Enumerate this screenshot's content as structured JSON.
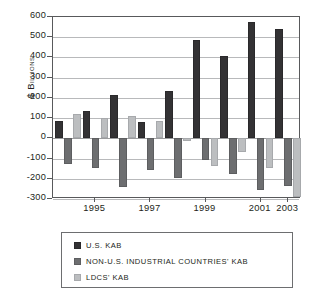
{
  "chart_data": {
    "type": "bar",
    "title": "",
    "subtitle": "",
    "xlabel": "",
    "ylabel": "$ BILLIONS",
    "ylim": [
      -300,
      600
    ],
    "ytick_values": [
      600,
      500,
      400,
      300,
      200,
      100,
      0,
      -100,
      -200,
      -300
    ],
    "ytick_labels": [
      "600",
      "500",
      "400",
      "300",
      "200",
      "100",
      "0",
      "-100",
      "-200",
      "-300"
    ],
    "grid": true,
    "grid_axis": "y",
    "legend_position": "below",
    "categories": [
      "1994",
      "1995",
      "1996",
      "1997",
      "1998",
      "1999",
      "2000",
      "2001",
      "2002"
    ],
    "xtick_labels": [
      "1995",
      "1997",
      "1999",
      "2001",
      "2003"
    ],
    "xtick_categories": [
      "1995",
      "1997",
      "1999",
      "2001",
      "2002"
    ],
    "series": [
      {
        "name": "U.S. KAB",
        "color": "#333234",
        "values": [
          85,
          135,
          215,
          80,
          235,
          485,
          405,
          575,
          540
        ]
      },
      {
        "name": "NON-U.S. INDUSTRIAL COUNTRIES' KAB",
        "color": "#6d6e70",
        "values": [
          -125,
          -145,
          -240,
          -155,
          -195,
          -105,
          -175,
          -255,
          -235
        ]
      },
      {
        "name": "LDCS' KAB",
        "color": "#bcbec0",
        "values": [
          120,
          100,
          110,
          85,
          -15,
          -135,
          -70,
          -145,
          -290
        ]
      }
    ]
  },
  "legend": {
    "items": [
      {
        "label": "U.S. KAB",
        "swatch": "series-0-swatch"
      },
      {
        "label": "NON-U.S. INDUSTRIAL COUNTRIES' KAB",
        "swatch": "series-1-swatch"
      },
      {
        "label": "LDCS' KAB",
        "swatch": "series-2-swatch"
      }
    ]
  },
  "axis": {
    "y_title_prefix": "$ B",
    "y_title_rest": "ILLIONS"
  }
}
